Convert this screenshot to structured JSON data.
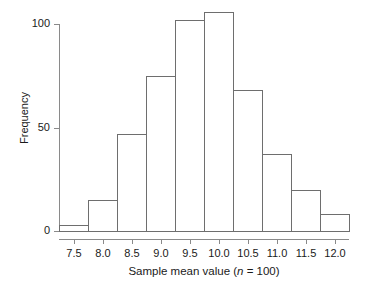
{
  "chart_data": {
    "type": "bar",
    "subtype": "histogram",
    "title": "",
    "xlabel": "Sample mean value (n = 100)",
    "ylabel": "Frequency",
    "bin_width": 0.5,
    "bin_edges": [
      7.25,
      7.75,
      8.25,
      8.75,
      9.25,
      9.75,
      10.25,
      10.75,
      11.25,
      11.75,
      12.25
    ],
    "categories": [
      "7.25-7.75",
      "7.75-8.25",
      "8.25-8.75",
      "8.75-9.25",
      "9.25-9.75",
      "9.75-10.25",
      "10.25-10.75",
      "10.75-11.25",
      "11.25-11.75",
      "11.75-12.25"
    ],
    "bin_centers": [
      7.5,
      8.0,
      8.5,
      9.0,
      9.5,
      10.0,
      10.5,
      11.0,
      11.5,
      12.0
    ],
    "values": [
      3,
      15,
      47,
      75,
      102,
      106,
      68,
      37,
      20,
      8
    ],
    "xlim": [
      7.25,
      12.25
    ],
    "ylim": [
      0,
      110
    ],
    "xticks": [
      7.5,
      8.0,
      8.5,
      9.0,
      9.5,
      10.0,
      10.5,
      11.0,
      11.5,
      12.0
    ],
    "xtick_labels": [
      "7.5",
      "8.0",
      "8.5",
      "9.0",
      "9.5",
      "10.0",
      "10.5",
      "11.0",
      "11.5",
      "12.0"
    ],
    "yticks": [
      0,
      50,
      100
    ],
    "ytick_labels": [
      "0",
      "50",
      "100"
    ],
    "grid": false,
    "legend": null,
    "bar_fill_color": "#ffffff",
    "bar_border_color": "#6e6e6e",
    "axis_color": "#8a8a8a",
    "text_color": "#1a1a1a",
    "background_color": "#ffffff"
  },
  "axis_titles": {
    "x_prefix": "Sample mean value (",
    "x_italic": "n",
    "x_suffix": " = 100)",
    "y": "Frequency"
  }
}
